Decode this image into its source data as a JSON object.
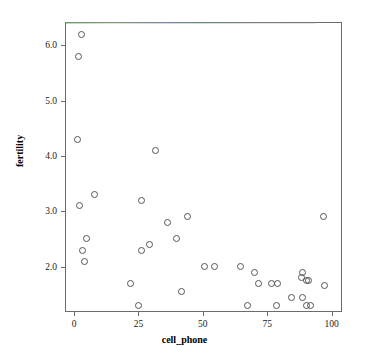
{
  "chart_data": {
    "type": "scatter",
    "title": "",
    "xlabel": "cell_phone",
    "ylabel": "fertility",
    "xlim": [
      -3.5,
      104
    ],
    "ylim": [
      1.18,
      6.42
    ],
    "xticks": [
      0,
      25,
      50,
      75,
      100
    ],
    "xticklabels": [
      "0",
      "25",
      "50",
      "75",
      "100"
    ],
    "yticks": [
      2.0,
      3.0,
      4.0,
      5.0,
      6.0
    ],
    "yticklabels": [
      "2.0",
      "3.0",
      "4.0",
      "5.0",
      "6.0"
    ],
    "grid": false,
    "legend": null,
    "marker": "open-circle",
    "marker_color": "#555555",
    "points": [
      {
        "x": 2.8,
        "y": 6.2
      },
      {
        "x": 1.7,
        "y": 5.8
      },
      {
        "x": 1.2,
        "y": 4.3
      },
      {
        "x": 31.8,
        "y": 4.1
      },
      {
        "x": 7.8,
        "y": 3.3
      },
      {
        "x": 26.3,
        "y": 3.2
      },
      {
        "x": 2.0,
        "y": 3.1
      },
      {
        "x": 97.0,
        "y": 2.9
      },
      {
        "x": 44.2,
        "y": 2.9
      },
      {
        "x": 36.3,
        "y": 2.8
      },
      {
        "x": 5.0,
        "y": 2.5
      },
      {
        "x": 39.7,
        "y": 2.5
      },
      {
        "x": 29.3,
        "y": 2.4
      },
      {
        "x": 3.3,
        "y": 2.3
      },
      {
        "x": 26.0,
        "y": 2.3
      },
      {
        "x": 4.2,
        "y": 2.1
      },
      {
        "x": 50.8,
        "y": 2.0
      },
      {
        "x": 54.6,
        "y": 2.0
      },
      {
        "x": 64.8,
        "y": 2.0
      },
      {
        "x": 88.5,
        "y": 1.9
      },
      {
        "x": 70.0,
        "y": 1.9
      },
      {
        "x": 88.3,
        "y": 1.8
      },
      {
        "x": 21.8,
        "y": 1.7
      },
      {
        "x": 71.5,
        "y": 1.7
      },
      {
        "x": 76.8,
        "y": 1.7
      },
      {
        "x": 78.8,
        "y": 1.7
      },
      {
        "x": 90.2,
        "y": 1.75
      },
      {
        "x": 91.0,
        "y": 1.75
      },
      {
        "x": 97.3,
        "y": 1.65
      },
      {
        "x": 41.7,
        "y": 1.55
      },
      {
        "x": 84.5,
        "y": 1.45
      },
      {
        "x": 88.7,
        "y": 1.45
      },
      {
        "x": 25.0,
        "y": 1.3
      },
      {
        "x": 67.5,
        "y": 1.3
      },
      {
        "x": 78.5,
        "y": 1.3
      },
      {
        "x": 90.3,
        "y": 1.3
      },
      {
        "x": 91.6,
        "y": 1.3
      }
    ]
  },
  "axes": {
    "x_label": "cell_phone",
    "y_label": "fertility"
  }
}
